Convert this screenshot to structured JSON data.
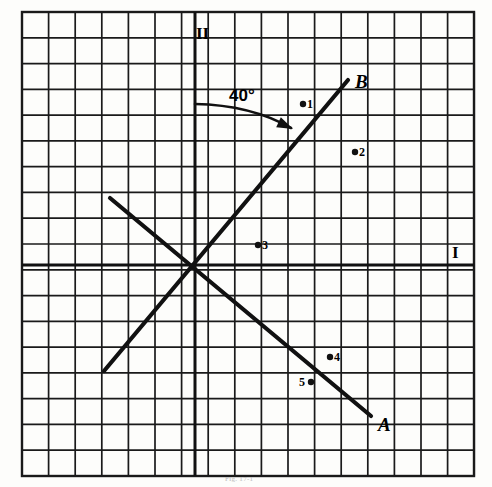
{
  "figure": {
    "caption": "Fig. 17-1",
    "background_color": "#fdfdfb",
    "ink_color": "#111111",
    "grid": {
      "color": "#1a1a1a",
      "cols": 17,
      "rows": 18,
      "cell_px": 26.6,
      "left": 22,
      "top": 12,
      "right": 474,
      "bottom": 476,
      "border": true
    },
    "axes": [
      {
        "name": "axis-I",
        "label": "I",
        "orientation": "horizontal",
        "y": 265,
        "x_start": 22,
        "x_end": 474
      },
      {
        "name": "axis-II",
        "label": "II",
        "orientation": "vertical",
        "x": 195,
        "y_start": 12,
        "y_end": 476
      }
    ],
    "axis_labels": {
      "horizontal": "I",
      "vertical": "II"
    },
    "lines": [
      {
        "name": "line-B",
        "label": "B",
        "x1": 104,
        "y1": 371,
        "x2": 348,
        "y2": 80,
        "label_x": 355,
        "label_y": 82
      },
      {
        "name": "line-A",
        "label": "A",
        "x1": 110,
        "y1": 198,
        "x2": 371,
        "y2": 416,
        "label_x": 378,
        "label_y": 425
      }
    ],
    "annotation": {
      "text": "40°",
      "text_x": 243,
      "text_y": 98,
      "arc_start_x": 195,
      "arc_start_y": 104,
      "arc_end_x": 291,
      "arc_end_y": 128,
      "arrow_tip_x": 293,
      "arrow_tip_y": 129
    },
    "points": [
      {
        "name": "point-1",
        "label": "1",
        "x": 303,
        "y": 104,
        "label_side": "right"
      },
      {
        "name": "point-2",
        "label": "2",
        "x": 355,
        "y": 152,
        "label_side": "right"
      },
      {
        "name": "point-3",
        "label": "3",
        "x": 258,
        "y": 245,
        "label_side": "right"
      },
      {
        "name": "point-4",
        "label": "4",
        "x": 330,
        "y": 357,
        "label_side": "right"
      },
      {
        "name": "point-5",
        "label": "5",
        "x": 311,
        "y": 382,
        "label_side": "left"
      }
    ]
  },
  "chart_data": {
    "type": "scatter",
    "xlabel": "I",
    "ylabel": "II",
    "grid": true,
    "legend": "none",
    "origin_px": {
      "x": 195,
      "y": 265
    },
    "cell_px": 26.6,
    "xlim": [
      -6.5,
      10.5
    ],
    "ylim": [
      -7.9,
      9.5
    ],
    "series": [
      {
        "name": "line B",
        "type": "line",
        "label": "B",
        "points_grid": [
          [
            -3.4,
            -4.0
          ],
          [
            5.8,
            7.0
          ]
        ]
      },
      {
        "name": "line A",
        "type": "line",
        "label": "A",
        "points_grid": [
          [
            -3.2,
            2.5
          ],
          [
            6.6,
            -5.7
          ]
        ]
      }
    ],
    "annotations": [
      {
        "text": "40°",
        "type": "angle",
        "value": 40,
        "unit": "degrees"
      },
      {
        "text": "I",
        "type": "axis-label"
      },
      {
        "text": "II",
        "type": "axis-label"
      }
    ],
    "scatter_points": [
      {
        "label": "1",
        "x_grid": 4.06,
        "y_grid": 6.05
      },
      {
        "label": "2",
        "x_grid": 6.02,
        "y_grid": 4.25
      },
      {
        "label": "3",
        "x_grid": 2.37,
        "y_grid": 0.75
      },
      {
        "label": "4",
        "x_grid": 5.08,
        "y_grid": -3.46
      },
      {
        "label": "5",
        "x_grid": 4.36,
        "y_grid": -4.4
      }
    ]
  }
}
